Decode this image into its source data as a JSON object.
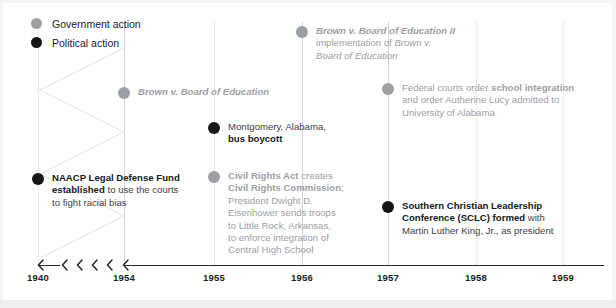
{
  "chart_data": {
    "type": "timeline",
    "title": "",
    "xlabel": "",
    "ylabel": "",
    "grid": true,
    "axis": {
      "tick_labels": [
        "1940",
        "1954",
        "1955",
        "1956",
        "1957",
        "1958",
        "1959"
      ],
      "has_break": true,
      "break_between": [
        "1940",
        "1954"
      ],
      "break_marker": "chevrons",
      "xlim": [
        "1940",
        "1959"
      ]
    },
    "legend": {
      "position": "top-left",
      "entries": [
        {
          "label": "Government action",
          "color": "#9aa0a6",
          "marker": "circle"
        },
        {
          "label": "Political action",
          "color": "#141619",
          "marker": "circle"
        }
      ]
    },
    "series": [
      {
        "name": "Government action",
        "color": "#9aa0a6",
        "events": [
          {
            "year": "1954",
            "lines": [
              [
                {
                  "text": "Brown v. Board of Education",
                  "style": "bold-italic"
                }
              ]
            ]
          },
          {
            "year": "1955",
            "lines": [
              [
                {
                  "text": "Brown v. Board of Education II",
                  "style": "bold-italic"
                }
              ],
              [
                {
                  "text": "implementation of ",
                  "style": "normal"
                },
                {
                  "text": "Brown v.",
                  "style": "italic"
                }
              ],
              [
                {
                  "text": "Board of Education",
                  "style": "italic"
                }
              ]
            ]
          },
          {
            "year": "1956",
            "lines": [
              [
                {
                  "text": "Federal courts order ",
                  "style": "normal"
                },
                {
                  "text": "school integration",
                  "style": "bold"
                }
              ],
              [
                {
                  "text": "and order Autherine Lucy admitted to",
                  "style": "normal"
                }
              ],
              [
                {
                  "text": "University of Alabama",
                  "style": "normal"
                }
              ]
            ]
          },
          {
            "year": "1957",
            "lines": [
              [
                {
                  "text": "Civil Rights Act",
                  "style": "bold"
                },
                {
                  "text": " creates",
                  "style": "normal"
                }
              ],
              [
                {
                  "text": "Civil Rights Commission",
                  "style": "bold"
                },
                {
                  "text": ";",
                  "style": "normal"
                }
              ],
              [
                {
                  "text": "President Dwight D.",
                  "style": "normal"
                }
              ],
              [
                {
                  "text": "Eisenhower sends troops",
                  "style": "normal"
                }
              ],
              [
                {
                  "text": "to Little Rock, Arkansas,",
                  "style": "normal"
                }
              ],
              [
                {
                  "text": "to enforce integration of",
                  "style": "normal"
                }
              ],
              [
                {
                  "text": "Central High School",
                  "style": "normal"
                }
              ]
            ]
          }
        ]
      },
      {
        "name": "Political action",
        "color": "#141619",
        "events": [
          {
            "year": "1940",
            "lines": [
              [
                {
                  "text": "NAACP Legal Defense Fund",
                  "style": "bold"
                }
              ],
              [
                {
                  "text": "established",
                  "style": "bold"
                },
                {
                  "text": " to use the courts",
                  "style": "normal"
                }
              ],
              [
                {
                  "text": "to fight racial bias",
                  "style": "normal"
                }
              ]
            ]
          },
          {
            "year": "1955",
            "lines": [
              [
                {
                  "text": "Montgomery, Alabama,",
                  "style": "normal"
                }
              ],
              [
                {
                  "text": "bus boycott",
                  "style": "bold"
                }
              ]
            ]
          },
          {
            "year": "1957",
            "lines": [
              [
                {
                  "text": "Southern Christian Leadership",
                  "style": "bold"
                }
              ],
              [
                {
                  "text": "Conference (SCLC) formed",
                  "style": "bold"
                },
                {
                  "text": " with",
                  "style": "normal"
                }
              ],
              [
                {
                  "text": "Martin Luther King, Jr., as president",
                  "style": "normal"
                }
              ]
            ]
          }
        ]
      }
    ]
  },
  "layout": {
    "gridlines": [
      {
        "year": "1940",
        "x": 38,
        "style": "dotted"
      },
      {
        "year": "1954",
        "x": 124,
        "style": "solid"
      },
      {
        "year": "1955",
        "x": 214,
        "style": "dotted"
      },
      {
        "year": "1956",
        "x": 302,
        "style": "solid"
      },
      {
        "year": "1957",
        "x": 388,
        "style": "solid"
      },
      {
        "year": "1958",
        "x": 476,
        "style": "dotted"
      },
      {
        "year": "1959",
        "x": 563,
        "style": "dotted"
      }
    ],
    "events": [
      {
        "id": "brown-1",
        "series": "gov",
        "x": 124,
        "y": 86
      },
      {
        "id": "federal-courts",
        "series": "gov",
        "x": 302,
        "y": 25
      },
      {
        "id": "civil-rights-act",
        "series": "gov",
        "x": 388,
        "y": 82
      },
      {
        "id": "brown-2",
        "series": "gov",
        "x": 214,
        "y": 170
      },
      {
        "id": "naacp",
        "series": "pol",
        "x": 38,
        "y": 172
      },
      {
        "id": "montgomery",
        "series": "pol",
        "x": 214,
        "y": 121
      },
      {
        "id": "sclc",
        "series": "pol",
        "x": 388,
        "y": 200
      }
    ]
  },
  "colors": {
    "government": "#9aa0a6",
    "political": "#141619",
    "axis": "#23272b",
    "grid": "#d3d6da",
    "background": "#ffffff"
  }
}
